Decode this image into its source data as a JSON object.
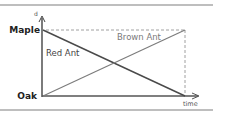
{
  "diagram": {
    "y_axis": {
      "label": "d",
      "top_label": "Maple",
      "bottom_label": "Oak"
    },
    "x_axis": {
      "label": "time"
    },
    "lines": [
      {
        "name": "Red Ant",
        "from": "Maple",
        "to": "Oak",
        "color": "#555555"
      },
      {
        "name": "Brown Ant",
        "from": "Oak",
        "to": "Maple",
        "color": "#7a7a7a"
      }
    ],
    "colors": {
      "axis": "#444444",
      "rule": "#9a9a9a",
      "dashed": "#888888",
      "text_dark": "#222222",
      "text_mid": "#555555",
      "text_light": "#777777"
    }
  }
}
